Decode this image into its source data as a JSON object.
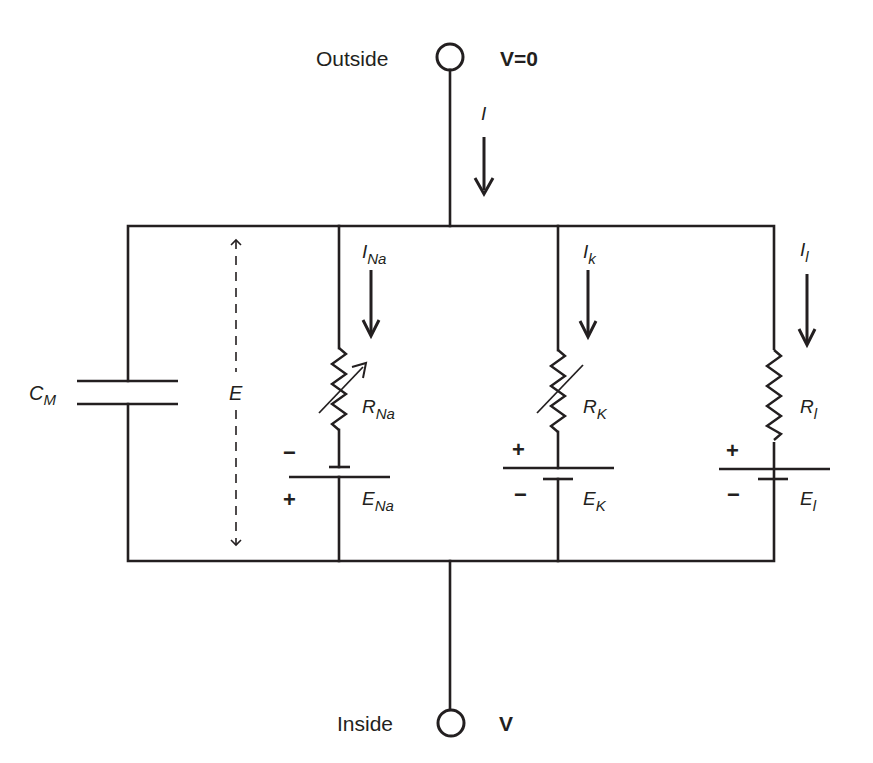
{
  "terminals": {
    "outside": {
      "label": "Outside",
      "voltage": "V=0"
    },
    "inside": {
      "label": "Inside",
      "voltage": "V"
    }
  },
  "total_current": {
    "symbol": "I"
  },
  "membrane_voltage": {
    "symbol": "E"
  },
  "capacitor": {
    "symbol": "C",
    "subscript": "M"
  },
  "branches": [
    {
      "id": "sodium",
      "current": {
        "symbol": "I",
        "subscript": "Na"
      },
      "resistor": {
        "symbol": "R",
        "subscript": "Na",
        "variable": true
      },
      "battery": {
        "symbol": "E",
        "subscript": "Na",
        "top_sign": "−",
        "bottom_sign": "+"
      }
    },
    {
      "id": "potassium",
      "current": {
        "symbol": "I",
        "subscript": "k"
      },
      "resistor": {
        "symbol": "R",
        "subscript": "K",
        "variable": true
      },
      "battery": {
        "symbol": "E",
        "subscript": "K",
        "top_sign": "+",
        "bottom_sign": "−"
      }
    },
    {
      "id": "leak",
      "current": {
        "symbol": "I",
        "subscript": "l"
      },
      "resistor": {
        "symbol": "R",
        "subscript": "l",
        "variable": false
      },
      "battery": {
        "symbol": "E",
        "subscript": "l",
        "top_sign": "+",
        "bottom_sign": "−"
      }
    }
  ],
  "colors": {
    "ink": "#231f20",
    "background": "#ffffff"
  }
}
